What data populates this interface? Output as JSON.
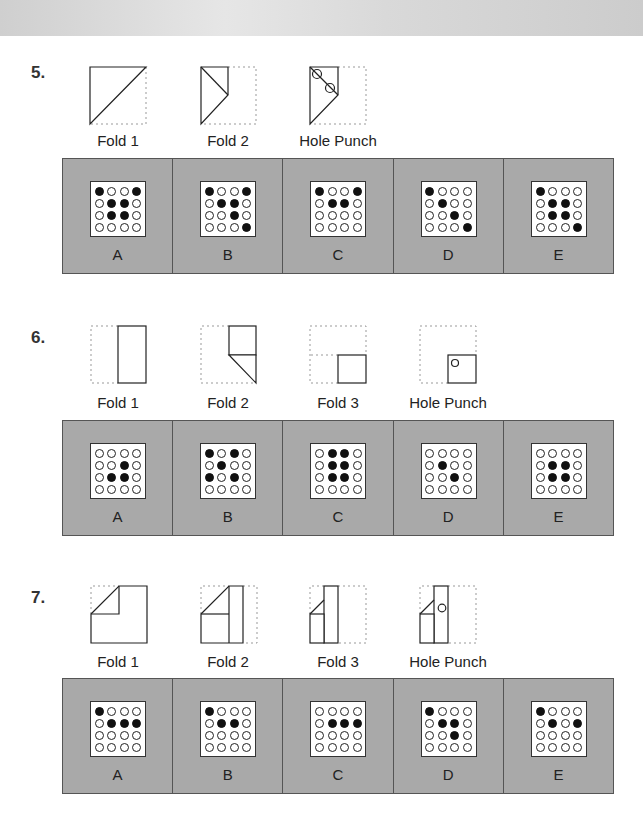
{
  "colors": {
    "panel_bg": "#a9a9a9",
    "panel_border": "#555555",
    "hole_filled": "#111111",
    "hole_empty": "#ffffff"
  },
  "questions": [
    {
      "number": "5.",
      "steps": [
        "Fold 1",
        "Fold 2",
        "Hole Punch"
      ],
      "options": [
        {
          "letter": "A",
          "grid": [
            [
              1,
              0,
              0,
              1
            ],
            [
              0,
              1,
              1,
              0
            ],
            [
              0,
              1,
              1,
              0
            ],
            [
              0,
              0,
              0,
              0
            ]
          ]
        },
        {
          "letter": "B",
          "grid": [
            [
              1,
              0,
              0,
              1
            ],
            [
              0,
              1,
              1,
              0
            ],
            [
              0,
              0,
              1,
              0
            ],
            [
              0,
              0,
              0,
              1
            ]
          ]
        },
        {
          "letter": "C",
          "grid": [
            [
              1,
              0,
              0,
              1
            ],
            [
              0,
              1,
              1,
              0
            ],
            [
              0,
              0,
              0,
              0
            ],
            [
              0,
              0,
              0,
              0
            ]
          ]
        },
        {
          "letter": "D",
          "grid": [
            [
              1,
              0,
              0,
              0
            ],
            [
              0,
              1,
              0,
              0
            ],
            [
              0,
              0,
              1,
              0
            ],
            [
              0,
              0,
              0,
              1
            ]
          ]
        },
        {
          "letter": "E",
          "grid": [
            [
              1,
              0,
              0,
              0
            ],
            [
              0,
              1,
              1,
              0
            ],
            [
              0,
              1,
              1,
              0
            ],
            [
              0,
              0,
              0,
              1
            ]
          ]
        }
      ]
    },
    {
      "number": "6.",
      "steps": [
        "Fold 1",
        "Fold 2",
        "Fold 3",
        "Hole Punch"
      ],
      "options": [
        {
          "letter": "A",
          "grid": [
            [
              0,
              0,
              0,
              0
            ],
            [
              0,
              0,
              1,
              0
            ],
            [
              0,
              1,
              1,
              0
            ],
            [
              0,
              0,
              0,
              0
            ]
          ]
        },
        {
          "letter": "B",
          "grid": [
            [
              1,
              0,
              1,
              0
            ],
            [
              0,
              1,
              0,
              0
            ],
            [
              1,
              0,
              1,
              0
            ],
            [
              0,
              0,
              0,
              0
            ]
          ]
        },
        {
          "letter": "C",
          "grid": [
            [
              0,
              1,
              1,
              0
            ],
            [
              0,
              1,
              1,
              0
            ],
            [
              0,
              1,
              1,
              0
            ],
            [
              0,
              0,
              0,
              0
            ]
          ]
        },
        {
          "letter": "D",
          "grid": [
            [
              0,
              0,
              0,
              0
            ],
            [
              0,
              1,
              0,
              0
            ],
            [
              0,
              0,
              1,
              0
            ],
            [
              0,
              0,
              0,
              0
            ]
          ]
        },
        {
          "letter": "E",
          "grid": [
            [
              0,
              0,
              0,
              0
            ],
            [
              0,
              1,
              1,
              0
            ],
            [
              0,
              1,
              1,
              0
            ],
            [
              0,
              0,
              0,
              0
            ]
          ]
        }
      ]
    },
    {
      "number": "7.",
      "steps": [
        "Fold 1",
        "Fold 2",
        "Fold 3",
        "Hole Punch"
      ],
      "options": [
        {
          "letter": "A",
          "grid": [
            [
              1,
              0,
              0,
              0
            ],
            [
              0,
              1,
              1,
              1
            ],
            [
              0,
              0,
              0,
              0
            ],
            [
              0,
              0,
              0,
              0
            ]
          ]
        },
        {
          "letter": "B",
          "grid": [
            [
              1,
              0,
              0,
              0
            ],
            [
              0,
              1,
              1,
              0
            ],
            [
              0,
              0,
              0,
              0
            ],
            [
              0,
              0,
              0,
              0
            ]
          ]
        },
        {
          "letter": "C",
          "grid": [
            [
              0,
              0,
              0,
              0
            ],
            [
              0,
              1,
              1,
              1
            ],
            [
              0,
              0,
              0,
              0
            ],
            [
              0,
              0,
              0,
              0
            ]
          ]
        },
        {
          "letter": "D",
          "grid": [
            [
              1,
              0,
              0,
              0
            ],
            [
              0,
              1,
              1,
              0
            ],
            [
              0,
              0,
              1,
              0
            ],
            [
              0,
              0,
              0,
              0
            ]
          ]
        },
        {
          "letter": "E",
          "grid": [
            [
              1,
              0,
              0,
              0
            ],
            [
              0,
              1,
              0,
              1
            ],
            [
              0,
              0,
              0,
              0
            ],
            [
              0,
              0,
              0,
              0
            ]
          ]
        }
      ]
    }
  ]
}
